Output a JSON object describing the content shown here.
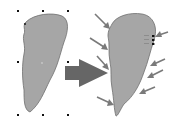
{
  "diagram": {
    "left_shape": {
      "label": "selected shape",
      "fill": "#a6a6a6",
      "stroke": "#6e6e6e",
      "handles": [
        [
          18,
          11
        ],
        [
          43,
          11
        ],
        [
          68,
          11
        ],
        [
          18,
          62
        ],
        [
          68,
          62
        ],
        [
          18,
          115
        ],
        [
          43,
          115
        ],
        [
          68,
          115
        ]
      ]
    },
    "transition_arrow": {
      "color": "#666666"
    },
    "right_shape": {
      "label": "shape with edited nodes",
      "fill": "#a6a6a6",
      "stroke": "#6e6e6e",
      "pointer_arrow_color": "#7a7a7a",
      "node_marker_color": "#111111"
    }
  }
}
